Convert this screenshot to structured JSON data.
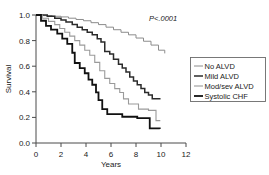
{
  "chart_data": {
    "type": "line",
    "title": "",
    "xlabel": "Years",
    "ylabel": "Survival",
    "xlim": [
      0,
      12
    ],
    "ylim": [
      0.0,
      1.0
    ],
    "xticks": [
      0,
      2,
      4,
      6,
      8,
      10,
      12
    ],
    "xtick_labels": [
      "0",
      "2",
      "4",
      "6",
      "8",
      "10",
      "12"
    ],
    "yticks": [
      0.0,
      0.2,
      0.4,
      0.6,
      0.8,
      1.0
    ],
    "ytick_labels": [
      "0.0",
      "0.2",
      "0.4",
      "0.6",
      "0.8",
      "1.0"
    ],
    "grid": false,
    "legend_position": "right-outside",
    "annotations": [
      {
        "text": "P<.0001",
        "x": 9.0,
        "y": 0.935
      }
    ],
    "series": [
      {
        "name": "No ALVD",
        "color": "#8c8c8c",
        "line_width": 1.0,
        "step": "post",
        "final_survival": 0.7,
        "x": [
          0,
          0.6,
          1.3,
          2.0,
          2.6,
          3.2,
          3.8,
          4.4,
          5.0,
          5.6,
          6.2,
          6.8,
          7.4,
          8.0,
          8.6,
          9.2,
          9.8,
          10.3
        ],
        "y": [
          1.0,
          0.995,
          0.99,
          0.985,
          0.975,
          0.965,
          0.955,
          0.94,
          0.925,
          0.905,
          0.885,
          0.865,
          0.845,
          0.82,
          0.795,
          0.765,
          0.725,
          0.7
        ]
      },
      {
        "name": "Mild ALVD",
        "color": "#2b2b2b",
        "line_width": 1.5,
        "step": "post",
        "final_survival": 0.34,
        "x": [
          0,
          0.9,
          1.5,
          2.0,
          2.4,
          2.9,
          3.3,
          3.7,
          4.1,
          4.5,
          4.9,
          5.2,
          5.5,
          5.9,
          6.2,
          6.6,
          6.9,
          7.2,
          7.5,
          7.8,
          8.1,
          8.4,
          8.7,
          9.0,
          9.3,
          9.9
        ],
        "y": [
          1.0,
          0.99,
          0.975,
          0.96,
          0.945,
          0.925,
          0.905,
          0.885,
          0.865,
          0.845,
          0.815,
          0.79,
          0.715,
          0.695,
          0.655,
          0.615,
          0.585,
          0.555,
          0.515,
          0.485,
          0.455,
          0.425,
          0.395,
          0.375,
          0.345,
          0.34
        ]
      },
      {
        "name": "Mod/sev ALVD",
        "color": "#9a9a9a",
        "line_width": 1.1,
        "step": "post",
        "final_survival": 0.17,
        "x": [
          0,
          0.5,
          1.0,
          1.5,
          1.9,
          2.3,
          2.7,
          3.1,
          3.5,
          3.9,
          4.3,
          4.7,
          5.1,
          5.5,
          5.9,
          6.3,
          6.7,
          7.0,
          7.4,
          8.2,
          9.0,
          9.6,
          9.9
        ],
        "y": [
          1.0,
          0.975,
          0.95,
          0.925,
          0.895,
          0.865,
          0.835,
          0.8,
          0.765,
          0.725,
          0.685,
          0.63,
          0.565,
          0.505,
          0.465,
          0.425,
          0.395,
          0.345,
          0.305,
          0.265,
          0.255,
          0.175,
          0.17
        ]
      },
      {
        "name": "Systolic CHF",
        "color": "#111111",
        "line_width": 1.8,
        "step": "post",
        "final_survival": 0.11,
        "x": [
          0,
          0.4,
          0.8,
          1.2,
          1.7,
          2.1,
          2.5,
          2.9,
          3.1,
          3.5,
          3.9,
          4.2,
          4.5,
          4.8,
          5.0,
          5.3,
          5.7,
          6.3,
          6.9,
          7.5,
          8.1,
          8.7,
          9.1,
          9.9
        ],
        "y": [
          1.0,
          0.955,
          0.915,
          0.885,
          0.855,
          0.815,
          0.775,
          0.705,
          0.625,
          0.585,
          0.545,
          0.495,
          0.455,
          0.395,
          0.335,
          0.265,
          0.225,
          0.225,
          0.205,
          0.205,
          0.195,
          0.195,
          0.115,
          0.11
        ]
      }
    ]
  },
  "legend": {
    "entries": [
      {
        "label": "No ALVD"
      },
      {
        "label": "Mild ALVD"
      },
      {
        "label": "Mod/sev ALVD"
      },
      {
        "label": "Systolic CHF"
      }
    ]
  },
  "axes": {
    "x_title": "Years",
    "y_title": "Survival"
  },
  "annotation": {
    "p_value": "P<.0001"
  }
}
